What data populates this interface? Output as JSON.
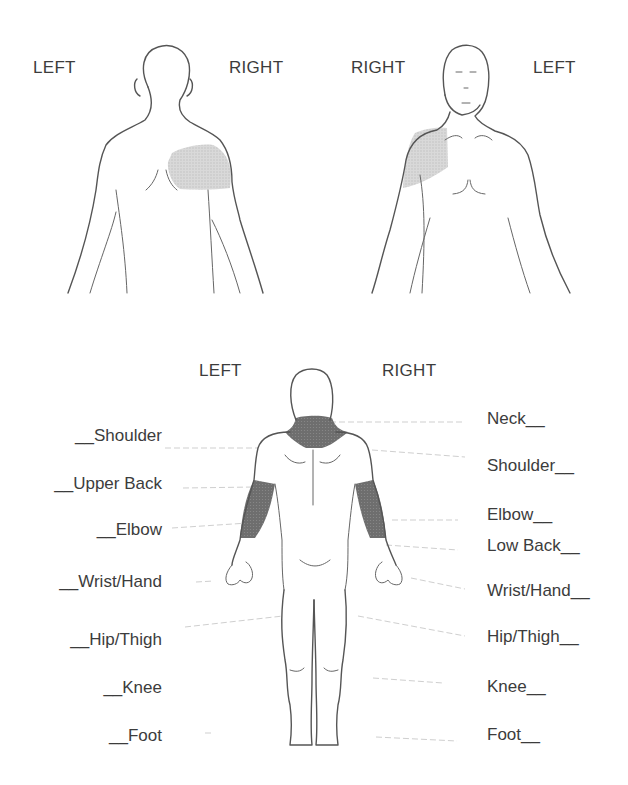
{
  "figure_top_back": {
    "left_label": "LEFT",
    "right_label": "RIGHT",
    "shaded_region": "right shoulder (back view)",
    "shade_color": "#d2d2d2"
  },
  "figure_top_front": {
    "left_label": "RIGHT",
    "right_label": "LEFT",
    "shaded_region": "right shoulder (front view)",
    "shade_color": "#d2d2d2"
  },
  "figure_bottom": {
    "left_label": "LEFT",
    "right_label": "RIGHT",
    "shaded_regions": [
      "neck",
      "left elbow",
      "right elbow"
    ],
    "shade_color": "#6a6a6a",
    "left_items": [
      {
        "label": "__Shoulder"
      },
      {
        "label": "__Upper Back"
      },
      {
        "label": "__Elbow"
      },
      {
        "label": "__Wrist/Hand"
      },
      {
        "label": "__Hip/Thigh"
      },
      {
        "label": "__Knee"
      },
      {
        "label": "__Foot"
      }
    ],
    "right_items": [
      {
        "label": "Neck__"
      },
      {
        "label": "Shoulder__"
      },
      {
        "label": "Elbow__"
      },
      {
        "label": "Low Back__"
      },
      {
        "label": "Wrist/Hand__"
      },
      {
        "label": "Hip/Thigh__"
      },
      {
        "label": "Knee__"
      },
      {
        "label": "Foot__"
      }
    ]
  }
}
